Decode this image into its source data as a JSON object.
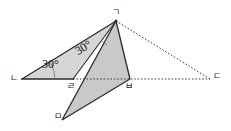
{
  "figure": {
    "width": 231,
    "height": 131,
    "background_color": "#ffffff",
    "stroke_color": "#2b2b2b",
    "fill_color": "#c9c9c9",
    "fill_color_light": "#d4d4d4"
  },
  "vertices": [
    {
      "id": "g",
      "label": "ㄱ",
      "x": 116,
      "y": 21,
      "label_x": 113,
      "label_y": 9
    },
    {
      "id": "n",
      "label": "ㄴ",
      "x": 22,
      "y": 79,
      "label_x": 10,
      "label_y": 76
    },
    {
      "id": "d",
      "label": "ㄷ",
      "x": 210,
      "y": 79,
      "label_x": 214,
      "label_y": 74
    },
    {
      "id": "r",
      "label": "ㄹ",
      "x": 73,
      "y": 79,
      "label_x": 67,
      "label_y": 82
    },
    {
      "id": "m",
      "label": "ㅁ",
      "x": 62,
      "y": 120,
      "label_x": 54,
      "label_y": 113
    },
    {
      "id": "b",
      "label": "ㅂ",
      "x": 130,
      "y": 79,
      "label_x": 126,
      "label_y": 82
    }
  ],
  "angles": [
    {
      "id": "angle-at-n",
      "value": "30°",
      "x": 43,
      "y": 63,
      "rotation": 0
    },
    {
      "id": "angle-at-g",
      "value": "30°",
      "x": 82,
      "y": 52,
      "rotation": -31
    }
  ],
  "segments": [
    {
      "id": "seg-n-g",
      "from": "n",
      "to": "g",
      "style": "solid"
    },
    {
      "id": "seg-n-r",
      "from": "n",
      "to": "r",
      "style": "solid"
    },
    {
      "id": "seg-r-g",
      "from": "r",
      "to": "g",
      "style": "solid"
    },
    {
      "id": "seg-g-b",
      "from": "g",
      "to": "b",
      "style": "solid"
    },
    {
      "id": "seg-g-m",
      "from": "g",
      "to": "m",
      "style": "solid"
    },
    {
      "id": "seg-m-b",
      "from": "m",
      "to": "b",
      "style": "solid"
    },
    {
      "id": "seg-g-d",
      "from": "g",
      "to": "d",
      "style": "dotted"
    },
    {
      "id": "seg-r-d",
      "from": "r",
      "to": "d",
      "style": "dotted"
    }
  ],
  "shaded_regions": [
    {
      "id": "region-n-g-r",
      "points": "n,g,r",
      "shade": "light"
    },
    {
      "id": "region-g-b-m",
      "points": "g,b,m",
      "shade": "normal"
    }
  ]
}
